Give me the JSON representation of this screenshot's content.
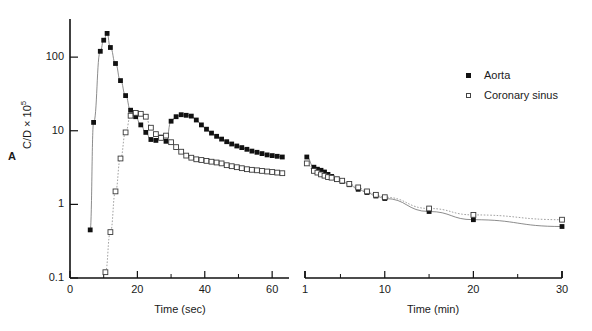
{
  "panel_letter": "A",
  "ylabel_main": "C/D × 10",
  "ylabel_exp": "5",
  "legend": {
    "items": [
      {
        "label": "Aorta",
        "marker": "filled-square",
        "color": "#111111"
      },
      {
        "label": "Coronary sinus",
        "marker": "open-square",
        "color": "#444444"
      }
    ]
  },
  "chart_data": {
    "type": "scatter",
    "title": "",
    "subtitle": "",
    "panel_label": "A",
    "ylabel": "C/D × 10⁵",
    "ylim": [
      0.1,
      300
    ],
    "yscale": "log",
    "ytick_labels": [
      "0.1",
      "1",
      "10",
      "100"
    ],
    "ytick_values": [
      0.1,
      1,
      10,
      100
    ],
    "grid": false,
    "legend_position": "top-right",
    "panels": [
      {
        "name": "left-panel",
        "xlabel": "Time (sec)",
        "xscale": "linear",
        "xlim": [
          0,
          65
        ],
        "xtick_labels": [
          "0",
          "20",
          "40",
          "60"
        ],
        "xtick_values": [
          0,
          20,
          40,
          60
        ],
        "xminor_ticks": [
          10,
          30,
          50
        ],
        "series": [
          {
            "name": "Aorta",
            "marker": "filled-square",
            "line": "solid",
            "points": [
              [
                6.0,
                0.45
              ],
              [
                7.0,
                13.0
              ],
              [
                9.0,
                120.0
              ],
              [
                10.0,
                170.0
              ],
              [
                11.0,
                210.0
              ],
              [
                12.0,
                135.0
              ],
              [
                13.5,
                82.0
              ],
              [
                15.0,
                48.0
              ],
              [
                16.5,
                30.0
              ],
              [
                18.0,
                19.0
              ],
              [
                19.5,
                15.5
              ],
              [
                21.0,
                12.0
              ],
              [
                22.5,
                9.5
              ],
              [
                24.0,
                7.6
              ],
              [
                25.5,
                7.4
              ],
              [
                27.0,
                8.2
              ],
              [
                28.5,
                7.2
              ],
              [
                30.0,
                13.5
              ],
              [
                31.5,
                15.5
              ],
              [
                33.0,
                16.5
              ],
              [
                34.5,
                16.2
              ],
              [
                36.0,
                15.8
              ],
              [
                37.5,
                14.0
              ],
              [
                39.0,
                12.0
              ],
              [
                40.5,
                10.5
              ],
              [
                42.0,
                9.3
              ],
              [
                43.5,
                8.4
              ],
              [
                45.0,
                7.7
              ],
              [
                46.5,
                7.1
              ],
              [
                48.0,
                6.6
              ],
              [
                49.5,
                6.2
              ],
              [
                51.0,
                5.9
              ],
              [
                52.5,
                5.6
              ],
              [
                54.0,
                5.3
              ],
              [
                55.5,
                5.1
              ],
              [
                57.0,
                4.9
              ],
              [
                58.5,
                4.7
              ],
              [
                60.0,
                4.6
              ],
              [
                61.5,
                4.5
              ],
              [
                63.0,
                4.4
              ]
            ]
          },
          {
            "name": "Coronary sinus",
            "marker": "open-square",
            "line": "dotted",
            "points": [
              [
                10.5,
                0.12
              ],
              [
                12.0,
                0.42
              ],
              [
                13.5,
                1.5
              ],
              [
                15.0,
                4.2
              ],
              [
                16.5,
                9.5
              ],
              [
                18.0,
                16.0
              ],
              [
                19.5,
                17.5
              ],
              [
                21.0,
                17.0
              ],
              [
                22.5,
                15.5
              ],
              [
                24.0,
                11.0
              ],
              [
                25.5,
                9.0
              ],
              [
                27.0,
                8.0
              ],
              [
                28.5,
                8.6
              ],
              [
                30.0,
                7.0
              ],
              [
                31.5,
                6.0
              ],
              [
                33.0,
                5.2
              ],
              [
                34.5,
                4.6
              ],
              [
                36.0,
                4.3
              ],
              [
                37.5,
                4.1
              ],
              [
                39.0,
                4.0
              ],
              [
                40.5,
                3.9
              ],
              [
                42.0,
                3.8
              ],
              [
                43.5,
                3.7
              ],
              [
                45.0,
                3.6
              ],
              [
                46.5,
                3.4
              ],
              [
                48.0,
                3.3
              ],
              [
                49.5,
                3.2
              ],
              [
                51.0,
                3.1
              ],
              [
                52.5,
                3.0
              ],
              [
                54.0,
                2.95
              ],
              [
                55.5,
                2.9
              ],
              [
                57.0,
                2.85
              ],
              [
                58.5,
                2.8
              ],
              [
                60.0,
                2.75
              ],
              [
                61.5,
                2.7
              ],
              [
                63.0,
                2.65
              ]
            ]
          }
        ]
      },
      {
        "name": "right-panel",
        "xlabel": "Time (min)",
        "xscale": "linear",
        "xlim": [
          1,
          30
        ],
        "xtick_labels": [
          "1",
          "10",
          "20",
          "30"
        ],
        "xtick_values": [
          1,
          10,
          20,
          30
        ],
        "xminor_ticks": [
          5,
          15,
          25
        ],
        "series": [
          {
            "name": "Aorta",
            "marker": "filled-square",
            "line": "solid",
            "points": [
              [
                1.2,
                4.4
              ],
              [
                2.0,
                3.2
              ],
              [
                2.4,
                3.0
              ],
              [
                2.8,
                2.9
              ],
              [
                3.2,
                2.75
              ],
              [
                3.6,
                2.55
              ],
              [
                4.0,
                2.4
              ],
              [
                4.6,
                2.2
              ],
              [
                5.2,
                2.05
              ],
              [
                6.0,
                1.85
              ],
              [
                7.0,
                1.6
              ],
              [
                8.0,
                1.45
              ],
              [
                9.0,
                1.3
              ],
              [
                10.0,
                1.2
              ],
              [
                15.0,
                0.8
              ],
              [
                20.0,
                0.62
              ],
              [
                30.0,
                0.5
              ]
            ]
          },
          {
            "name": "Coronary sinus",
            "marker": "open-square",
            "line": "dotted",
            "points": [
              [
                1.2,
                3.6
              ],
              [
                2.0,
                2.85
              ],
              [
                2.4,
                2.7
              ],
              [
                2.8,
                2.55
              ],
              [
                3.2,
                2.45
              ],
              [
                3.6,
                2.35
              ],
              [
                4.0,
                2.3
              ],
              [
                4.6,
                2.2
              ],
              [
                5.2,
                2.1
              ],
              [
                6.0,
                1.9
              ],
              [
                7.0,
                1.7
              ],
              [
                8.0,
                1.5
              ],
              [
                9.0,
                1.35
              ],
              [
                10.0,
                1.25
              ],
              [
                15.0,
                0.88
              ],
              [
                20.0,
                0.72
              ],
              [
                30.0,
                0.62
              ]
            ]
          }
        ]
      }
    ]
  }
}
